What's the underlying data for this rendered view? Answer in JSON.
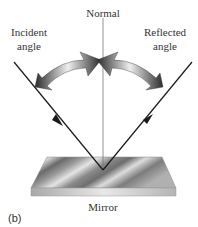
{
  "labels": {
    "normal": "Normal",
    "incident_line1": "Incident",
    "incident_line2": "angle",
    "reflected_line1": "Reflected",
    "reflected_line2": "angle",
    "mirror": "Mirror",
    "subfigure": "(b)"
  },
  "colors": {
    "ray": "#1a1a1a",
    "normal_line": "#777777",
    "arrow_dark": "#2e2e2e",
    "arrow_light": "#e8e8e8",
    "mirror_dark": "#6e6e6e",
    "mirror_light": "#e6e6e6",
    "text": "#333333"
  },
  "geometry": {
    "normal": {
      "x": 103,
      "y1": 18,
      "y2": 170
    },
    "incident_ray": {
      "x1": 14,
      "y1": 62,
      "x2": 103,
      "y2": 170
    },
    "reflected_ray": {
      "x1": 103,
      "y1": 170,
      "x2": 192,
      "y2": 62
    },
    "mirror_top": [
      [
        47,
        157
      ],
      [
        162,
        157
      ],
      [
        176,
        188
      ],
      [
        31,
        188
      ]
    ]
  }
}
